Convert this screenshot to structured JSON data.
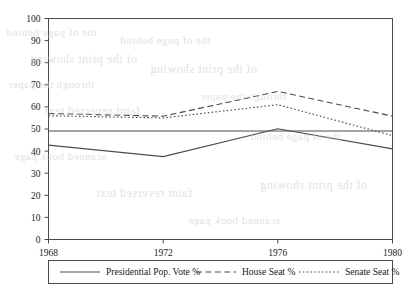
{
  "chart_data": {
    "type": "line",
    "title": "",
    "subtitle": "",
    "xlabel": "",
    "ylabel": "",
    "x": [
      1968,
      1972,
      1976,
      1980
    ],
    "xtick_labels": [
      "1968",
      "1972",
      "1976",
      "1980"
    ],
    "ytick_labels": [
      "0",
      "10",
      "20",
      "30",
      "40",
      "50",
      "60",
      "70",
      "80",
      "90",
      "100"
    ],
    "ytick_values": [
      0,
      10,
      20,
      30,
      40,
      50,
      60,
      70,
      80,
      90,
      100
    ],
    "xlim": [
      1968,
      1980
    ],
    "ylim": [
      0,
      100
    ],
    "grid": false,
    "legend_position": "bottom-outside",
    "series": [
      {
        "name": "Presidential Pop. Vote %",
        "style": "solid",
        "values": [
          42.7,
          37.5,
          50.1,
          41.0
        ]
      },
      {
        "name": "House Seat %",
        "style": "dashed",
        "values": [
          57.0,
          55.8,
          67.0,
          55.8
        ]
      },
      {
        "name": "Senate Seat %",
        "style": "dotted",
        "values": [
          56.0,
          55.0,
          61.0,
          47.0
        ]
      }
    ],
    "reference_line": {
      "name": "fifty-percent-line",
      "value": 50
    }
  },
  "legend": {
    "items": [
      {
        "label": "Presidential Pop. Vote %",
        "style": "solid"
      },
      {
        "label": "House Seat %",
        "style": "dashed"
      },
      {
        "label": "Senate Seat %",
        "style": "dotted"
      }
    ]
  },
  "bleed_through": {
    "lines": [
      "the of page behind",
      "of the print showing",
      "through the paper",
      "faint reversed text",
      "scanned book page"
    ]
  }
}
